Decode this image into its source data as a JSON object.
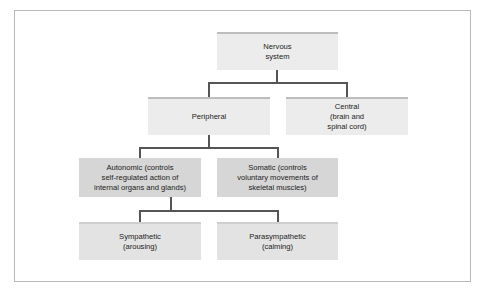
{
  "diagram": {
    "type": "hierarchy",
    "colors": {
      "connector": "#555555",
      "frame": "#b9b9b9",
      "level1_fill": "#ececec",
      "level2_fill": "#ececec",
      "level3_fill": "#d6d6d6",
      "level4_fill": "#e3e3e3",
      "text": "#222222"
    },
    "nodes": {
      "nervous": {
        "label": "Nervous\nsystem"
      },
      "peripheral": {
        "label": "Peripheral"
      },
      "central": {
        "label": "Central\n(brain and\nspinal cord)"
      },
      "autonomic": {
        "label": "Autonomic (controls\nself-regulated action of\ninternal organs and glands)"
      },
      "somatic": {
        "label": "Somatic (controls\nvoluntary movements of\nskeletal muscles)"
      },
      "sympathetic": {
        "label": "Sympathetic\n(arousing)"
      },
      "parasympathetic": {
        "label": "Parasympathetic\n(calming)"
      }
    },
    "edges": [
      {
        "from": "Nervous system",
        "to": "Peripheral"
      },
      {
        "from": "Nervous system",
        "to": "Central"
      },
      {
        "from": "Peripheral",
        "to": "Autonomic"
      },
      {
        "from": "Peripheral",
        "to": "Somatic"
      },
      {
        "from": "Autonomic",
        "to": "Sympathetic"
      },
      {
        "from": "Autonomic",
        "to": "Parasympathetic"
      }
    ]
  }
}
